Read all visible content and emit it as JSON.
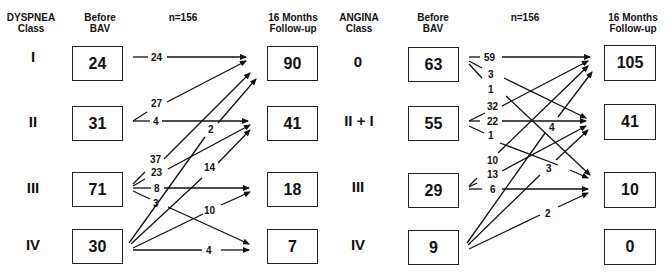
{
  "dyspnea": {
    "class_header": "DYSPNEA\nClass",
    "before_header": "Before\nBAV",
    "n_label": "n=156",
    "after_header": "16 Months\nFollow-up",
    "classes": [
      "I",
      "II",
      "III",
      "IV"
    ],
    "before": [
      "24",
      "31",
      "71",
      "30"
    ],
    "after": [
      "90",
      "41",
      "18",
      "7"
    ],
    "flows": [
      {
        "from": "I",
        "to": "I",
        "value": "24"
      },
      {
        "from": "II",
        "to": "I",
        "value": "27"
      },
      {
        "from": "II",
        "to": "II",
        "value": "4"
      },
      {
        "from": "III",
        "to": "I",
        "value": "37"
      },
      {
        "from": "III",
        "to": "II",
        "value": "23"
      },
      {
        "from": "III",
        "to": "III",
        "value": "8"
      },
      {
        "from": "III",
        "to": "IV",
        "value": "3"
      },
      {
        "from": "IV",
        "to": "I",
        "value": "2"
      },
      {
        "from": "IV",
        "to": "II",
        "value": "14"
      },
      {
        "from": "IV",
        "to": "III",
        "value": "10"
      },
      {
        "from": "IV",
        "to": "IV",
        "value": "4"
      }
    ]
  },
  "angina": {
    "class_header": "ANGINA\nClass",
    "before_header": "Before\nBAV",
    "n_label": "n=156",
    "after_header": "16 Months\nFollow-up",
    "classes": [
      "0",
      "II + I",
      "III",
      "IV"
    ],
    "before": [
      "63",
      "55",
      "29",
      "9"
    ],
    "after": [
      "105",
      "41",
      "10",
      "0"
    ],
    "flows": [
      {
        "from": "0",
        "to": "0",
        "value": "59"
      },
      {
        "from": "0",
        "to": "II + I",
        "value": "3"
      },
      {
        "from": "0",
        "to": "III",
        "value": "1"
      },
      {
        "from": "II + I",
        "to": "0",
        "value": "32"
      },
      {
        "from": "II + I",
        "to": "II + I",
        "value": "22"
      },
      {
        "from": "II + I",
        "to": "III",
        "value": "1"
      },
      {
        "from": "III",
        "to": "0",
        "value": "10"
      },
      {
        "from": "III",
        "to": "II + I",
        "value": "13"
      },
      {
        "from": "III",
        "to": "III",
        "value": "6"
      },
      {
        "from": "IV",
        "to": "0",
        "value": "4"
      },
      {
        "from": "IV",
        "to": "II + I",
        "value": "3"
      },
      {
        "from": "IV",
        "to": "III",
        "value": "2"
      }
    ]
  }
}
